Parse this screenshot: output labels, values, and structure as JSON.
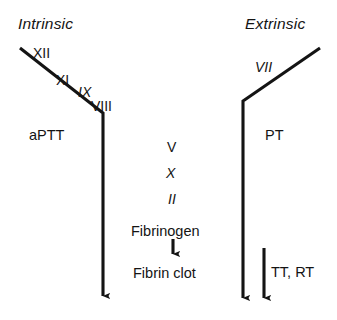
{
  "figure": {
    "background_color": "#ffffff",
    "stroke_color": "#141414",
    "type": "coagulation-cascade-diagram"
  },
  "headings": {
    "intrinsic": "Intrinsic",
    "extrinsic": "Extrinsic"
  },
  "intrinsic_pathway": {
    "factors": [
      {
        "label": "XII",
        "style": "normal"
      },
      {
        "label": "XI",
        "style": "normal"
      },
      {
        "label": "IX",
        "style": "italic"
      },
      {
        "label": "VIII",
        "style": "normal"
      }
    ],
    "assay": "aPTT"
  },
  "extrinsic_pathway": {
    "factors": [
      {
        "label": "VII",
        "style": "italic"
      }
    ],
    "assay": "PT"
  },
  "common_pathway": {
    "factors": [
      {
        "label": "V",
        "style": "normal"
      },
      {
        "label": "X",
        "style": "italic"
      },
      {
        "label": "II",
        "style": "italic"
      }
    ],
    "substrate": "Fibrinogen",
    "product": "Fibrin clot"
  },
  "additional_assays": {
    "label": "TT, RT"
  }
}
